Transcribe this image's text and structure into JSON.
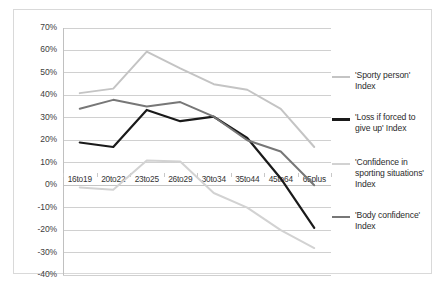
{
  "chart_data": {
    "type": "line",
    "title": "",
    "xlabel": "",
    "ylabel": "",
    "categories": [
      "16to19",
      "20to22",
      "23to25",
      "26to29",
      "30to34",
      "35to44",
      "45to64",
      "65plus"
    ],
    "ylim": [
      -40,
      70
    ],
    "ytick_labels": [
      "70%",
      "60%",
      "50%",
      "40%",
      "30%",
      "20%",
      "10%",
      "0%",
      "-10%",
      "-20%",
      "-30%",
      "-40%"
    ],
    "ytick_values": [
      70,
      60,
      50,
      40,
      30,
      20,
      10,
      0,
      -10,
      -20,
      -30,
      -40
    ],
    "grid": true,
    "legend_position": "right",
    "value_suffix": "%",
    "series": [
      {
        "name": "'Sporty person' Index",
        "color": "#c4c4c4",
        "width": 2,
        "values": [
          41,
          43,
          59.5,
          52,
          45,
          42.5,
          34,
          17
        ]
      },
      {
        "name": "'Loss if forced to give up' Index",
        "color": "#1a1a1a",
        "width": 2.2,
        "values": [
          19,
          17,
          33.5,
          28.5,
          30.5,
          21,
          3,
          -19
        ]
      },
      {
        "name": "'Confidence in sporting situations' Index",
        "color": "#d2d2d2",
        "width": 2,
        "values": [
          -1,
          -2,
          11,
          10.5,
          -3.5,
          -10,
          -20,
          -28
        ]
      },
      {
        "name": "'Body confidence' Index",
        "color": "#777777",
        "width": 2,
        "values": [
          34,
          38,
          35,
          37,
          30.5,
          20,
          15,
          0
        ]
      }
    ]
  },
  "legend": {
    "entries": [
      {
        "label": "'Sporty person' Index"
      },
      {
        "label": "'Loss if forced to give up' Index"
      },
      {
        "label": "'Confidence in sporting situations' Index"
      },
      {
        "label": "'Body confidence' Index"
      }
    ]
  }
}
